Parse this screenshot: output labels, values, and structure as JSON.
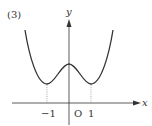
{
  "problem_label": "(3)",
  "axes": {
    "x_label": "x",
    "y_label": "y",
    "origin_label": "O"
  },
  "ticks": {
    "x": [
      {
        "value": -1,
        "label": "−1"
      },
      {
        "value": 1,
        "label": "1"
      }
    ]
  },
  "curve": {
    "description": "W-shaped quartic curve with minima at x = -1 and x = 1 and a local maximum on the y-axis",
    "minima_x": [
      -1,
      1
    ],
    "local_max_x": 0,
    "color": "#333333"
  },
  "guides": {
    "style": "dotted vertical lines from minima down to x-axis"
  },
  "colors": {
    "stroke": "#333333",
    "guide": "#888888",
    "background": "#ffffff"
  }
}
